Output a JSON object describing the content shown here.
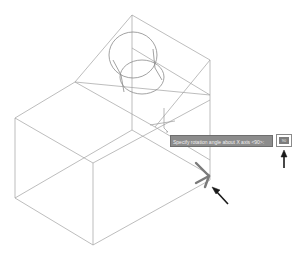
{
  "prompt": {
    "text": "Specify rotation angle about X axis <90>:",
    "input_value": "90"
  },
  "colors": {
    "wireframe": "#9a9a9a",
    "gizmo": "#7a7a7a",
    "callout_arrow": "#1a1a1a",
    "tooltip_bg": "#8c8c8c"
  },
  "icons": {
    "gizmo": "x-axis-rotation-gizmo",
    "cursor": "crosshair-cursor",
    "arrow_gizmo": "callout-arrow",
    "arrow_input": "callout-arrow"
  }
}
